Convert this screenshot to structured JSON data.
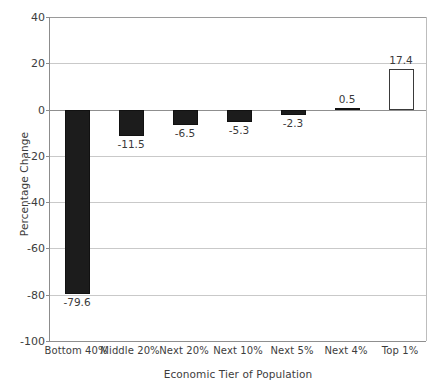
{
  "chart_data": {
    "type": "bar",
    "title": "",
    "subtitle": "",
    "xlabel": "Economic Tier of Population",
    "ylabel": "Percentage Change",
    "categories": [
      "Bottom 40%",
      "Middle 20%",
      "Next 20%",
      "Next 10%",
      "Next 5%",
      "Next 4%",
      "Top 1%"
    ],
    "values": [
      -79.6,
      -11.5,
      -6.5,
      -5.3,
      -2.3,
      0.5,
      17.4
    ],
    "value_labels": [
      "-79.6",
      "-11.5",
      "-6.5",
      "-5.3",
      "-2.3",
      "0.5",
      "17.4"
    ],
    "bar_styles": [
      "filled",
      "filled",
      "filled",
      "filled",
      "filled",
      "filled",
      "hollow"
    ],
    "ylim": [
      -100,
      40
    ],
    "yticks": [
      40,
      20,
      0,
      -20,
      -40,
      -60,
      -80,
      -100
    ],
    "ytick_labels": [
      "40",
      "20",
      "0",
      "-20",
      "-40",
      "-60",
      "-80",
      "-100"
    ],
    "grid": true,
    "legend": null,
    "colors": {
      "bar_fill": "#1c1c1c",
      "bar_outline": "#111111",
      "hollow_fill": "#ffffff",
      "hollow_outline": "#3a3a3a",
      "gridline": "#c9c9c9",
      "axis": "#8c8c8c",
      "text": "#3d3d3d",
      "background": "#ffffff"
    }
  }
}
